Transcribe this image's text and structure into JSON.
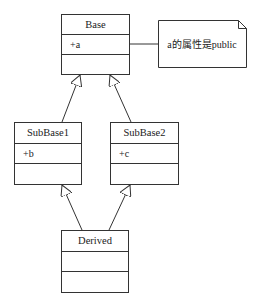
{
  "diagram": {
    "type": "uml-class-diagram",
    "classes": [
      {
        "id": "base",
        "name": "Base",
        "attributes": [
          "+a"
        ],
        "operations": []
      },
      {
        "id": "subbase1",
        "name": "SubBase1",
        "attributes": [
          "+b"
        ],
        "operations": []
      },
      {
        "id": "subbase2",
        "name": "SubBase2",
        "attributes": [
          "+c"
        ],
        "operations": []
      },
      {
        "id": "derived",
        "name": "Derived",
        "attributes": [],
        "operations": []
      }
    ],
    "note": {
      "text": "a的属性是public",
      "attached_to": "base"
    },
    "relations": [
      {
        "type": "generalization",
        "from": "SubBase1",
        "to": "Base"
      },
      {
        "type": "generalization",
        "from": "SubBase2",
        "to": "Base"
      },
      {
        "type": "generalization",
        "from": "Derived",
        "to": "SubBase1"
      },
      {
        "type": "generalization",
        "from": "Derived",
        "to": "SubBase2"
      }
    ]
  },
  "colors": {
    "line": "#333333",
    "background": "#ffffff",
    "text": "#222222"
  }
}
